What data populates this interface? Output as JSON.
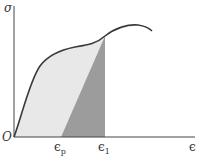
{
  "diagram": {
    "type": "stress-strain curve with unloading line",
    "y_axis_label": "σ",
    "x_axis_label": "ϵ",
    "origin_label": "O",
    "tick_labels": [
      {
        "symbol": "ϵ",
        "subscript": "p"
      },
      {
        "symbol": "ϵ",
        "subscript": "1"
      }
    ],
    "colors": {
      "curve": "#3a3a3a",
      "axis": "#444444",
      "light_region": "#e6e6e6",
      "dark_region": "#9a9a9a"
    }
  }
}
